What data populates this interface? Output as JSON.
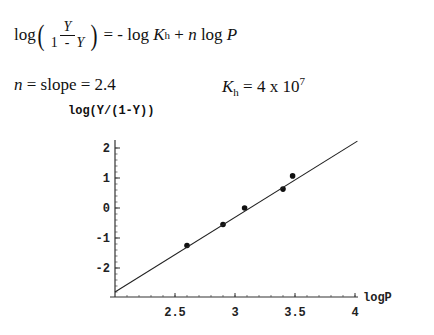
{
  "equation": {
    "prefix": "log",
    "frac_num": "Y",
    "frac_den_a": "1  -  ",
    "frac_den_b": "Y",
    "rhs_a": " = - log ",
    "K": "K",
    "K_sub": "h",
    "rhs_b": " + ",
    "n": "n",
    "rhs_c": " log ",
    "P": "P"
  },
  "results": {
    "slope_n": "n",
    "slope_text": " = slope = 2.4",
    "kh_K": "K",
    "kh_sub": "h",
    "kh_text": " = 4 x 10",
    "kh_exp": "7"
  },
  "chart_data": {
    "type": "scatter",
    "title": "",
    "xlabel": "logP",
    "ylabel": "log(Y/(1-Y))",
    "xlim": [
      2.0,
      4.05
    ],
    "ylim": [
      -2.95,
      2.3
    ],
    "xticks": [
      2.5,
      3,
      3.5,
      4
    ],
    "xtick_labels": [
      "2.5",
      "3",
      "3.5",
      "4"
    ],
    "yticks": [
      -2,
      -1,
      0,
      1,
      2
    ],
    "ytick_labels": [
      "-2",
      "-1",
      "0",
      "1",
      "2"
    ],
    "grid": false,
    "legend": null,
    "series": [
      {
        "name": "data",
        "type": "scatter",
        "x": [
          2.6,
          2.9,
          3.08,
          3.4,
          3.48
        ],
        "y": [
          -1.25,
          -0.55,
          0.0,
          0.63,
          1.07
        ]
      },
      {
        "name": "fit",
        "type": "line",
        "x": [
          2.0,
          4.02
        ],
        "y": [
          -2.8,
          2.23
        ]
      }
    ]
  }
}
